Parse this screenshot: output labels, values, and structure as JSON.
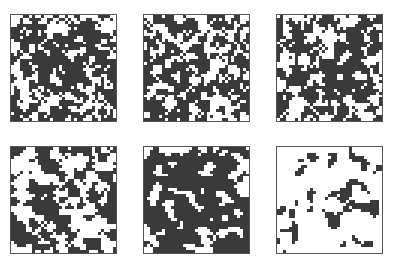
{
  "figure": {
    "layout": {
      "rows": 2,
      "cols": 3
    },
    "panels": [
      {
        "id": "p1",
        "x": 10,
        "y": 14,
        "density": 0.62,
        "seed": 11,
        "cluster": 0.55
      },
      {
        "id": "p2",
        "x": 143,
        "y": 14,
        "density": 0.58,
        "seed": 23,
        "cluster": 0.55
      },
      {
        "id": "p3",
        "x": 276,
        "y": 14,
        "density": 0.6,
        "seed": 37,
        "cluster": 0.6
      },
      {
        "id": "p4",
        "x": 10,
        "y": 146,
        "density": 0.5,
        "seed": 41,
        "cluster": 0.7
      },
      {
        "id": "p5",
        "x": 143,
        "y": 146,
        "density": 0.74,
        "seed": 53,
        "cluster": 0.75
      },
      {
        "id": "p6",
        "x": 276,
        "y": 146,
        "density": 0.18,
        "seed": 67,
        "cluster": 0.75
      }
    ],
    "colors": {
      "ink": "#3a3a3a",
      "paper": "#ffffff",
      "border": "#555555"
    }
  }
}
